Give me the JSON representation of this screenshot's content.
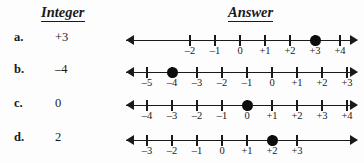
{
  "headers": {
    "integer": "Integer",
    "answer": "Answer"
  },
  "style": {
    "ink": "#1a1a1a",
    "background": "#fdfdfd",
    "dot_color": "#0d0d0d"
  },
  "rows": [
    {
      "letter": "a.",
      "integer": "+3",
      "line": {
        "left": 126,
        "right": 357,
        "top": 31,
        "tick_start_px": 64,
        "tick_spacing_px": 25,
        "labels": [
          "–2",
          "–1",
          "0",
          "+1",
          "+2",
          "+3",
          "+4"
        ],
        "marked_index": 5,
        "marked_value": "+3"
      }
    },
    {
      "letter": "b.",
      "integer": "–4",
      "line": {
        "left": 126,
        "right": 357,
        "top": 63,
        "tick_start_px": 21,
        "tick_spacing_px": 25,
        "labels": [
          "–5",
          "–4",
          "–3",
          "–2",
          "–1",
          "0",
          "+1",
          "+2",
          "+3"
        ],
        "marked_index": 1,
        "marked_value": "–4"
      }
    },
    {
      "letter": "c.",
      "integer": "0",
      "line": {
        "left": 126,
        "right": 357,
        "top": 96,
        "tick_start_px": 21,
        "tick_spacing_px": 25,
        "labels": [
          "–4",
          "–3",
          "–2",
          "–1",
          "0",
          "+1",
          "+2",
          "+3",
          "+4"
        ],
        "marked_index": 4,
        "marked_value": "0"
      }
    },
    {
      "letter": "d.",
      "integer": "2",
      "line": {
        "left": 126,
        "right": 357,
        "top": 131,
        "tick_start_px": 21,
        "tick_spacing_px": 25,
        "labels": [
          "–3",
          "–2",
          "–1",
          "0",
          "+1",
          "+2",
          "+3"
        ],
        "marked_index": 5,
        "marked_value": "+2"
      }
    }
  ]
}
